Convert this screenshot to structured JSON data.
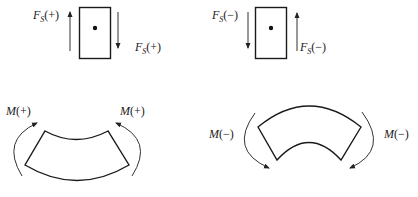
{
  "diagram": {
    "shear_positive": {
      "label_left": {
        "symbol": "F",
        "subscript": "S",
        "sign": "(+)"
      },
      "label_right": {
        "symbol": "F",
        "subscript": "S",
        "sign": "(+)"
      },
      "left_arrow": "up",
      "right_arrow": "down"
    },
    "shear_negative": {
      "label_left": {
        "symbol": "F",
        "subscript": "S",
        "sign": "(−)"
      },
      "label_right": {
        "symbol": "F",
        "subscript": "S",
        "sign": "(−)"
      },
      "left_arrow": "down",
      "right_arrow": "up"
    },
    "moment_positive": {
      "label_left": {
        "symbol": "M",
        "sign": "(+)"
      },
      "label_right": {
        "symbol": "M",
        "sign": "(+)"
      },
      "shape": "concave-up segment (sagging)"
    },
    "moment_negative": {
      "label_left": {
        "symbol": "M",
        "sign": "(−)"
      },
      "label_right": {
        "symbol": "M",
        "sign": "(−)"
      },
      "shape": "convex-up segment (hogging)"
    },
    "colors": {
      "stroke": "#1a1a1a",
      "arrow": "#333333",
      "background": "#ffffff"
    }
  }
}
